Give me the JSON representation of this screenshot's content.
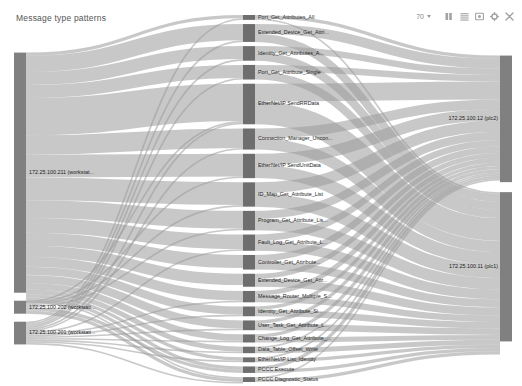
{
  "header": {
    "title": "Message type patterns",
    "zoom": {
      "value": "70",
      "caret_icon": "chevron-down-icon"
    },
    "tools": [
      {
        "name": "columns-icon",
        "label": "Columns"
      },
      {
        "name": "list-icon",
        "label": "List"
      },
      {
        "name": "image-icon",
        "label": "Snapshot"
      },
      {
        "name": "gear-icon",
        "label": "Settings"
      },
      {
        "name": "close-icon",
        "label": "Close"
      }
    ]
  },
  "palette": {
    "node": "#808080",
    "node_dark": "#6e6e6e",
    "link": "#9a9a9a",
    "background": "#ffffff",
    "text": "#2b2b2b"
  },
  "chart_data": {
    "type": "sankey",
    "title": "Message type patterns",
    "xlabel": "",
    "ylabel": "",
    "legend": "none",
    "grid": false,
    "columns": [
      {
        "name": "source-hosts",
        "x": 0.05
      },
      {
        "name": "message-types",
        "x": 0.48
      },
      {
        "name": "target-hosts",
        "x": 0.95
      }
    ],
    "nodes": [
      {
        "id": "src0",
        "label": "172.25.100.211 (workstat...",
        "column": 0,
        "value": 148
      },
      {
        "id": "src1",
        "label": "172.25.100.202 (workstati...",
        "column": 0,
        "value": 8
      },
      {
        "id": "src2",
        "label": "172.25.100.201 (workstati...",
        "column": 0,
        "value": 14
      },
      {
        "id": "m00",
        "label": "Port_Get_Attributes_All",
        "column": 1,
        "value": 3
      },
      {
        "id": "m01",
        "label": "Extended_Device_Get_Attri...",
        "column": 1,
        "value": 11
      },
      {
        "id": "m02",
        "label": "Identity_Get_Attributes_A...",
        "column": 1,
        "value": 9
      },
      {
        "id": "m03",
        "label": "Port_Get_Attribute_Single",
        "column": 1,
        "value": 9
      },
      {
        "id": "m04",
        "label": "EtherNet/IP SendRRData",
        "column": 1,
        "value": 25
      },
      {
        "id": "m05",
        "label": "Connection_Manager_Uncon...",
        "column": 1,
        "value": 13
      },
      {
        "id": "m06",
        "label": "EtherNet/IP SendUnitData",
        "column": 1,
        "value": 15
      },
      {
        "id": "m07",
        "label": "ID_Map_Get_Attribute_List",
        "column": 1,
        "value": 15
      },
      {
        "id": "m08",
        "label": "Program_Get_Attribute_Lis...",
        "column": 1,
        "value": 12
      },
      {
        "id": "m09",
        "label": "Fault_Log_Get_Attribute_L...",
        "column": 1,
        "value": 10
      },
      {
        "id": "m10",
        "label": "Controller_Get_Attribute...",
        "column": 1,
        "value": 9
      },
      {
        "id": "m11",
        "label": "Extended_Device_Get_Attr...",
        "column": 1,
        "value": 8
      },
      {
        "id": "m12",
        "label": "Message_Router_Multiple_S...",
        "column": 1,
        "value": 7
      },
      {
        "id": "m13",
        "label": "Identity_Get_Attribute_Si...",
        "column": 1,
        "value": 6
      },
      {
        "id": "m14",
        "label": "User_Task_Get_Attribute_L...",
        "column": 1,
        "value": 6
      },
      {
        "id": "m15",
        "label": "Change_Log_Get_Attribute_...",
        "column": 1,
        "value": 5
      },
      {
        "id": "m16",
        "label": "Data_Table_Offset_Write",
        "column": 1,
        "value": 4
      },
      {
        "id": "m17",
        "label": "EtherNet/IP List_Identity",
        "column": 1,
        "value": 3
      },
      {
        "id": "m18",
        "label": "PCCC Execute",
        "column": 1,
        "value": 4
      },
      {
        "id": "m19",
        "label": "PCCC Diagnostic_Status",
        "column": 1,
        "value": 3
      },
      {
        "id": "dst0",
        "label": "172.25.100.12 (plc2)",
        "column": 2,
        "value": 78
      },
      {
        "id": "dst1",
        "label": "172.25.100.11 (plc1)",
        "column": 2,
        "value": 92
      }
    ],
    "links": [
      {
        "source": "src0",
        "target": "m00",
        "value": 2
      },
      {
        "source": "src0",
        "target": "m01",
        "value": 10
      },
      {
        "source": "src0",
        "target": "m02",
        "value": 8
      },
      {
        "source": "src0",
        "target": "m03",
        "value": 8
      },
      {
        "source": "src0",
        "target": "m04",
        "value": 23
      },
      {
        "source": "src0",
        "target": "m05",
        "value": 12
      },
      {
        "source": "src0",
        "target": "m06",
        "value": 14
      },
      {
        "source": "src0",
        "target": "m07",
        "value": 14
      },
      {
        "source": "src0",
        "target": "m08",
        "value": 11
      },
      {
        "source": "src0",
        "target": "m09",
        "value": 9
      },
      {
        "source": "src0",
        "target": "m10",
        "value": 8
      },
      {
        "source": "src0",
        "target": "m11",
        "value": 7
      },
      {
        "source": "src0",
        "target": "m12",
        "value": 6
      },
      {
        "source": "src0",
        "target": "m13",
        "value": 5
      },
      {
        "source": "src0",
        "target": "m14",
        "value": 5
      },
      {
        "source": "src0",
        "target": "m15",
        "value": 4
      },
      {
        "source": "src0",
        "target": "m16",
        "value": 3
      },
      {
        "source": "src0",
        "target": "m17",
        "value": 2
      },
      {
        "source": "src0",
        "target": "m18",
        "value": 2
      },
      {
        "source": "src0",
        "target": "m19",
        "value": 1
      },
      {
        "source": "src1",
        "target": "m04",
        "value": 1
      },
      {
        "source": "src1",
        "target": "m06",
        "value": 1
      },
      {
        "source": "src1",
        "target": "m07",
        "value": 1
      },
      {
        "source": "src1",
        "target": "m08",
        "value": 1
      },
      {
        "source": "src1",
        "target": "m18",
        "value": 2
      },
      {
        "source": "src1",
        "target": "m19",
        "value": 2
      },
      {
        "source": "src2",
        "target": "m00",
        "value": 1
      },
      {
        "source": "src2",
        "target": "m01",
        "value": 1
      },
      {
        "source": "src2",
        "target": "m02",
        "value": 1
      },
      {
        "source": "src2",
        "target": "m03",
        "value": 1
      },
      {
        "source": "src2",
        "target": "m04",
        "value": 1
      },
      {
        "source": "src2",
        "target": "m05",
        "value": 1
      },
      {
        "source": "src2",
        "target": "m09",
        "value": 1
      },
      {
        "source": "src2",
        "target": "m12",
        "value": 1
      },
      {
        "source": "src2",
        "target": "m13",
        "value": 1
      },
      {
        "source": "src2",
        "target": "m14",
        "value": 1
      },
      {
        "source": "src2",
        "target": "m15",
        "value": 1
      },
      {
        "source": "src2",
        "target": "m16",
        "value": 1
      },
      {
        "source": "src2",
        "target": "m17",
        "value": 1
      },
      {
        "source": "src2",
        "target": "m19",
        "value": 1
      },
      {
        "source": "m00",
        "target": "dst0",
        "value": 2
      },
      {
        "source": "m00",
        "target": "dst1",
        "value": 1
      },
      {
        "source": "m01",
        "target": "dst0",
        "value": 6
      },
      {
        "source": "m01",
        "target": "dst1",
        "value": 5
      },
      {
        "source": "m02",
        "target": "dst0",
        "value": 4
      },
      {
        "source": "m02",
        "target": "dst1",
        "value": 5
      },
      {
        "source": "m03",
        "target": "dst0",
        "value": 4
      },
      {
        "source": "m03",
        "target": "dst1",
        "value": 5
      },
      {
        "source": "m04",
        "target": "dst0",
        "value": 11
      },
      {
        "source": "m04",
        "target": "dst1",
        "value": 14
      },
      {
        "source": "m05",
        "target": "dst0",
        "value": 6
      },
      {
        "source": "m05",
        "target": "dst1",
        "value": 7
      },
      {
        "source": "m06",
        "target": "dst0",
        "value": 7
      },
      {
        "source": "m06",
        "target": "dst1",
        "value": 8
      },
      {
        "source": "m07",
        "target": "dst0",
        "value": 7
      },
      {
        "source": "m07",
        "target": "dst1",
        "value": 8
      },
      {
        "source": "m08",
        "target": "dst0",
        "value": 5
      },
      {
        "source": "m08",
        "target": "dst1",
        "value": 7
      },
      {
        "source": "m09",
        "target": "dst0",
        "value": 4
      },
      {
        "source": "m09",
        "target": "dst1",
        "value": 6
      },
      {
        "source": "m10",
        "target": "dst0",
        "value": 4
      },
      {
        "source": "m10",
        "target": "dst1",
        "value": 5
      },
      {
        "source": "m11",
        "target": "dst0",
        "value": 3
      },
      {
        "source": "m11",
        "target": "dst1",
        "value": 5
      },
      {
        "source": "m12",
        "target": "dst0",
        "value": 3
      },
      {
        "source": "m12",
        "target": "dst1",
        "value": 4
      },
      {
        "source": "m13",
        "target": "dst0",
        "value": 2
      },
      {
        "source": "m13",
        "target": "dst1",
        "value": 4
      },
      {
        "source": "m14",
        "target": "dst0",
        "value": 2
      },
      {
        "source": "m14",
        "target": "dst1",
        "value": 4
      },
      {
        "source": "m15",
        "target": "dst0",
        "value": 2
      },
      {
        "source": "m15",
        "target": "dst1",
        "value": 3
      },
      {
        "source": "m16",
        "target": "dst0",
        "value": 1
      },
      {
        "source": "m16",
        "target": "dst1",
        "value": 3
      },
      {
        "source": "m17",
        "target": "dst0",
        "value": 1
      },
      {
        "source": "m17",
        "target": "dst1",
        "value": 2
      },
      {
        "source": "m18",
        "target": "dst0",
        "value": 2
      },
      {
        "source": "m18",
        "target": "dst1",
        "value": 2
      },
      {
        "source": "m19",
        "target": "dst0",
        "value": 1
      },
      {
        "source": "m19",
        "target": "dst1",
        "value": 2
      }
    ]
  }
}
